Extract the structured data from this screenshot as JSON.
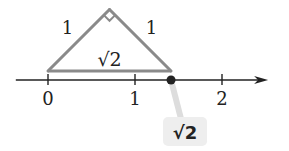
{
  "diagram": {
    "title": "",
    "number_line": {
      "ticks": [
        {
          "value": 0,
          "label": "0"
        },
        {
          "value": 1,
          "label": "1"
        },
        {
          "value": 2,
          "label": "2"
        }
      ],
      "range": [
        -0.37,
        2.53
      ],
      "arrow": "right"
    },
    "triangle": {
      "leg_left_label": "1",
      "leg_right_label": "1",
      "hypotenuse_label": "√2",
      "right_angle": true
    },
    "point": {
      "value": 1.41421,
      "callout_label": "√2"
    },
    "colors": {
      "triangle_stroke": "#8a8a8a",
      "axis": "#222222",
      "point": "#222222",
      "callout_bg": "#eeeeee",
      "text": "#222222"
    }
  }
}
